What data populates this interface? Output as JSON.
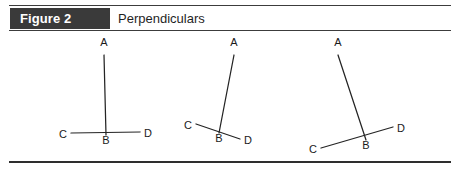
{
  "figure": {
    "tag_label": "Figure 2",
    "title": "Perpendiculars",
    "tag_background": "#3a3a3a",
    "tag_text_color": "#ffffff",
    "rule_color": "#3c3c3c",
    "stroke_color": "#242424",
    "background": "#ffffff"
  },
  "diagrams": [
    {
      "name": "perpendicular-vertical",
      "caption": "",
      "vertices": {
        "A": {
          "label": "A",
          "x": 49,
          "y": 14
        },
        "B": {
          "label": "B",
          "x": 51,
          "y": 112
        },
        "C": {
          "label": "C",
          "x": 8,
          "y": 102
        },
        "D": {
          "label": "D",
          "x": 93,
          "y": 101
        }
      },
      "segments": [
        {
          "name": "segment-AB",
          "from": "A",
          "to": "B"
        },
        {
          "name": "segment-CD",
          "from": "C",
          "to": "D"
        }
      ]
    },
    {
      "name": "perpendicular-tilted-left",
      "caption": "",
      "vertices": {
        "A": {
          "label": "A",
          "x": 54,
          "y": 14
        },
        "B": {
          "label": "B",
          "x": 39,
          "y": 110
        },
        "C": {
          "label": "C",
          "x": 8,
          "y": 93
        },
        "D": {
          "label": "D",
          "x": 68,
          "y": 108
        }
      },
      "segments": [
        {
          "name": "segment-AB",
          "from": "A",
          "to": "B"
        },
        {
          "name": "segment-CD",
          "from": "C",
          "to": "D"
        }
      ]
    },
    {
      "name": "perpendicular-tilted-right",
      "caption": "",
      "vertices": {
        "A": {
          "label": "A",
          "x": 38,
          "y": 14
        },
        "B": {
          "label": "B",
          "x": 66,
          "y": 117
        },
        "C": {
          "label": "C",
          "x": 13,
          "y": 117
        },
        "D": {
          "label": "D",
          "x": 101,
          "y": 96
        }
      },
      "segments": [
        {
          "name": "segment-AB",
          "from": "A",
          "to": "B"
        },
        {
          "name": "segment-CD",
          "from": "C",
          "to": "D"
        }
      ]
    }
  ]
}
